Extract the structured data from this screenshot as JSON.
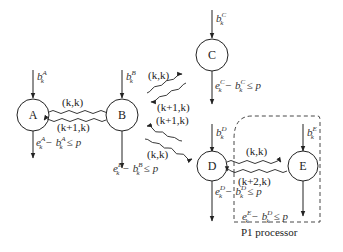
{
  "nodes": {
    "A": {
      "label": "A",
      "input": "b",
      "input_sup": "A",
      "input_sub": "k",
      "output": "e_k^A − b_k^A ≤ p"
    },
    "B": {
      "label": "B",
      "input": "b",
      "input_sup": "B",
      "input_sub": "k",
      "output": "e_k^B − b_k^B ≤ p"
    },
    "C": {
      "label": "C",
      "input": "b",
      "input_sup": "C",
      "input_sub": "k",
      "output": "e_k^C − b_k^C ≤ p"
    },
    "D": {
      "label": "D",
      "input": "b",
      "input_sup": "D",
      "input_sub": "k",
      "output": "e_k^D − b_k^D ≤ p"
    },
    "E": {
      "label": "E",
      "input": "b",
      "input_sup": "E",
      "input_sub": "k",
      "output": "e_k^E − b_k^D ≤ p"
    }
  },
  "messages": {
    "ab_fwd": "(k,k)",
    "ab_back": "(k+1,k)",
    "bc_fwd": "(k,k)",
    "bc_back": "(k+1,k)",
    "bd_back": "(k+1,k)",
    "bd_fwd": "(k,k)",
    "de_fwd": "(k,k)",
    "de_back": "(k+2,k)"
  },
  "math": {
    "e": "e",
    "b": "b",
    "k": "k",
    "minus": "−",
    "leq": "≤",
    "p": "p"
  },
  "group": {
    "label": "P1 processor"
  }
}
